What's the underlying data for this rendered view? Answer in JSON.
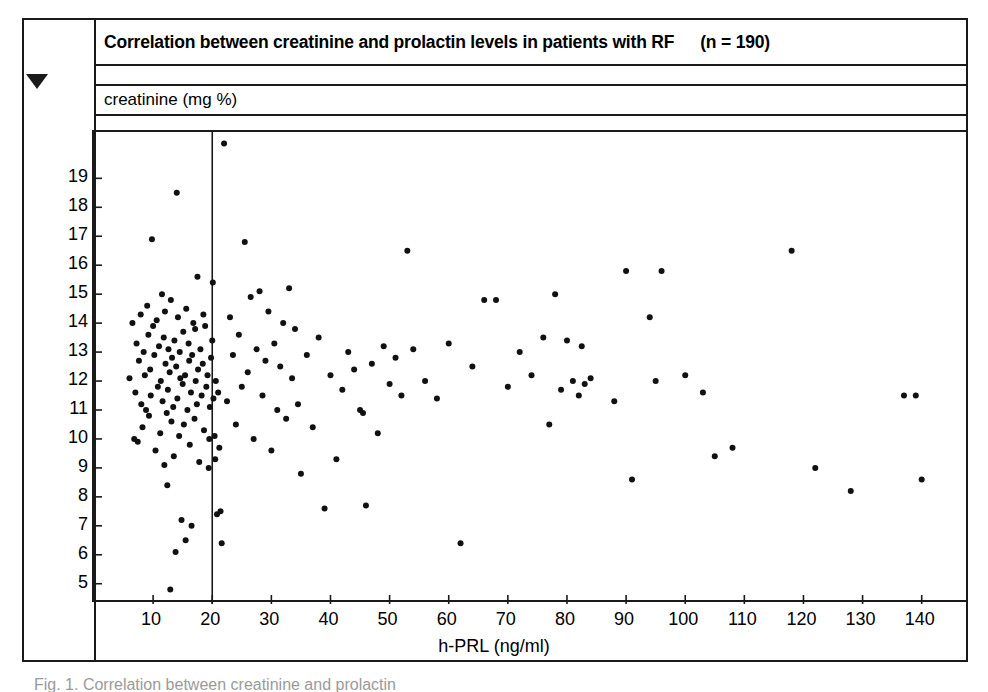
{
  "figure": {
    "title": "Correlation between creatinine and prolactin levels in patients  with RF",
    "sample_size_label": "(n = 190)",
    "y_axis_caption": "creatinine (mg %)",
    "x_axis_caption": "h-PRL (ng/ml)",
    "caption": "Fig.  1.   Correlation between creatinine and prolactin",
    "marker_icon": "triangle-down-icon",
    "ink_color": "#1a1a1a",
    "point_color": "#111111",
    "background_color": "#ffffff"
  },
  "chart_data": {
    "type": "scatter",
    "title": "Correlation between creatinine and prolactin levels in patients with RF",
    "subtitle": "(n = 190)",
    "xlabel": "h-PRL (ng/ml)",
    "ylabel": "creatinine (mg %)",
    "xlim": [
      0,
      148
    ],
    "ylim": [
      4.3,
      20.6
    ],
    "xticks": [
      10,
      20,
      30,
      40,
      50,
      60,
      70,
      80,
      90,
      100,
      110,
      120,
      130,
      140
    ],
    "yticks": [
      5,
      6,
      7,
      8,
      9,
      10,
      11,
      12,
      13,
      14,
      15,
      16,
      17,
      18,
      19
    ],
    "grid": false,
    "legend": "none",
    "point_radius_px": 3,
    "reference_lines": [
      {
        "orientation": "vertical",
        "x": 20,
        "label": ""
      }
    ],
    "points": [
      [
        6.0,
        12.1
      ],
      [
        6.5,
        14.0
      ],
      [
        6.8,
        10.0
      ],
      [
        7.0,
        11.6
      ],
      [
        7.2,
        13.3
      ],
      [
        7.4,
        9.9
      ],
      [
        7.6,
        12.7
      ],
      [
        7.9,
        14.3
      ],
      [
        8.0,
        11.2
      ],
      [
        8.2,
        10.4
      ],
      [
        8.4,
        13.0
      ],
      [
        8.6,
        12.2
      ],
      [
        8.8,
        11.0
      ],
      [
        9.0,
        14.6
      ],
      [
        9.2,
        13.6
      ],
      [
        9.3,
        10.8
      ],
      [
        9.5,
        12.4
      ],
      [
        9.6,
        11.5
      ],
      [
        9.8,
        16.9
      ],
      [
        10.0,
        13.9
      ],
      [
        10.2,
        12.9
      ],
      [
        10.4,
        9.6
      ],
      [
        10.6,
        14.1
      ],
      [
        10.8,
        11.8
      ],
      [
        11.0,
        13.2
      ],
      [
        11.2,
        10.2
      ],
      [
        11.3,
        12.0
      ],
      [
        11.5,
        15.0
      ],
      [
        11.6,
        11.3
      ],
      [
        11.8,
        13.5
      ],
      [
        11.9,
        9.1
      ],
      [
        12.0,
        14.4
      ],
      [
        12.1,
        12.6
      ],
      [
        12.3,
        10.9
      ],
      [
        12.4,
        8.4
      ],
      [
        12.5,
        11.7
      ],
      [
        12.6,
        13.1
      ],
      [
        12.8,
        12.3
      ],
      [
        12.9,
        4.8
      ],
      [
        13.0,
        14.8
      ],
      [
        13.1,
        10.6
      ],
      [
        13.2,
        12.8
      ],
      [
        13.4,
        11.1
      ],
      [
        13.5,
        9.4
      ],
      [
        13.6,
        13.4
      ],
      [
        13.8,
        6.1
      ],
      [
        13.9,
        12.5
      ],
      [
        14.0,
        18.5
      ],
      [
        14.1,
        11.4
      ],
      [
        14.2,
        14.2
      ],
      [
        14.4,
        10.1
      ],
      [
        14.5,
        13.0
      ],
      [
        14.6,
        12.1
      ],
      [
        14.8,
        7.2
      ],
      [
        15.0,
        11.9
      ],
      [
        15.1,
        13.7
      ],
      [
        15.2,
        10.5
      ],
      [
        15.4,
        12.2
      ],
      [
        15.5,
        6.5
      ],
      [
        15.6,
        14.5
      ],
      [
        15.8,
        11.0
      ],
      [
        16.0,
        13.3
      ],
      [
        16.1,
        12.7
      ],
      [
        16.2,
        9.8
      ],
      [
        16.4,
        11.6
      ],
      [
        16.5,
        7.0
      ],
      [
        16.6,
        12.9
      ],
      [
        16.8,
        14.0
      ],
      [
        17.0,
        10.7
      ],
      [
        17.1,
        13.8
      ],
      [
        17.2,
        12.0
      ],
      [
        17.4,
        11.2
      ],
      [
        17.5,
        15.6
      ],
      [
        17.6,
        12.4
      ],
      [
        17.8,
        9.2
      ],
      [
        18.0,
        13.1
      ],
      [
        18.2,
        11.5
      ],
      [
        18.4,
        12.6
      ],
      [
        18.5,
        14.3
      ],
      [
        18.6,
        10.3
      ],
      [
        18.8,
        13.9
      ],
      [
        19.0,
        11.8
      ],
      [
        19.2,
        12.2
      ],
      [
        19.4,
        9.0
      ],
      [
        19.5,
        10.0
      ],
      [
        19.6,
        11.1
      ],
      [
        19.8,
        12.8
      ],
      [
        20.0,
        13.4
      ],
      [
        20.1,
        15.4
      ],
      [
        20.2,
        11.4
      ],
      [
        20.4,
        10.1
      ],
      [
        20.5,
        9.3
      ],
      [
        20.6,
        12.0
      ],
      [
        20.8,
        7.4
      ],
      [
        21.0,
        11.6
      ],
      [
        21.2,
        9.7
      ],
      [
        21.4,
        7.5
      ],
      [
        21.6,
        6.4
      ],
      [
        22.0,
        20.2
      ],
      [
        22.5,
        11.3
      ],
      [
        23.0,
        14.2
      ],
      [
        23.5,
        12.9
      ],
      [
        24.0,
        10.5
      ],
      [
        24.5,
        13.6
      ],
      [
        25.0,
        11.8
      ],
      [
        25.5,
        16.8
      ],
      [
        26.0,
        12.3
      ],
      [
        26.5,
        14.9
      ],
      [
        27.0,
        10.0
      ],
      [
        27.5,
        13.1
      ],
      [
        28.0,
        15.1
      ],
      [
        28.5,
        11.5
      ],
      [
        29.0,
        12.7
      ],
      [
        29.5,
        14.4
      ],
      [
        30.0,
        9.6
      ],
      [
        30.5,
        13.3
      ],
      [
        31.0,
        11.0
      ],
      [
        31.5,
        12.5
      ],
      [
        32.0,
        14.0
      ],
      [
        32.5,
        10.7
      ],
      [
        33.0,
        15.2
      ],
      [
        33.5,
        12.1
      ],
      [
        34.0,
        13.8
      ],
      [
        34.5,
        11.2
      ],
      [
        35.0,
        8.8
      ],
      [
        36.0,
        12.9
      ],
      [
        37.0,
        10.4
      ],
      [
        38.0,
        13.5
      ],
      [
        39.0,
        7.6
      ],
      [
        40.0,
        12.2
      ],
      [
        41.0,
        9.3
      ],
      [
        42.0,
        11.7
      ],
      [
        43.0,
        13.0
      ],
      [
        44.0,
        12.4
      ],
      [
        45.0,
        11.0
      ],
      [
        45.5,
        10.9
      ],
      [
        46.0,
        7.7
      ],
      [
        47.0,
        12.6
      ],
      [
        48.0,
        10.2
      ],
      [
        49.0,
        13.2
      ],
      [
        50.0,
        11.9
      ],
      [
        51.0,
        12.8
      ],
      [
        52.0,
        11.5
      ],
      [
        53.0,
        16.5
      ],
      [
        54.0,
        13.1
      ],
      [
        56.0,
        12.0
      ],
      [
        58.0,
        11.4
      ],
      [
        60.0,
        13.3
      ],
      [
        62.0,
        6.4
      ],
      [
        64.0,
        12.5
      ],
      [
        66.0,
        14.8
      ],
      [
        68.0,
        14.8
      ],
      [
        70.0,
        11.8
      ],
      [
        72.0,
        13.0
      ],
      [
        74.0,
        12.2
      ],
      [
        76.0,
        13.5
      ],
      [
        77.0,
        10.5
      ],
      [
        78.0,
        15.0
      ],
      [
        79.0,
        11.7
      ],
      [
        80.0,
        13.4
      ],
      [
        81.0,
        12.0
      ],
      [
        82.0,
        11.5
      ],
      [
        82.5,
        13.2
      ],
      [
        83.0,
        11.9
      ],
      [
        84.0,
        12.1
      ],
      [
        88.0,
        11.3
      ],
      [
        90.0,
        15.8
      ],
      [
        91.0,
        8.6
      ],
      [
        94.0,
        14.2
      ],
      [
        95.0,
        12.0
      ],
      [
        96.0,
        15.8
      ],
      [
        100.0,
        12.2
      ],
      [
        103.0,
        11.6
      ],
      [
        105.0,
        9.4
      ],
      [
        108.0,
        9.7
      ],
      [
        118.0,
        16.5
      ],
      [
        122.0,
        9.0
      ],
      [
        128.0,
        8.2
      ],
      [
        137.0,
        11.5
      ],
      [
        139.0,
        11.5
      ],
      [
        140.0,
        8.6
      ]
    ]
  }
}
